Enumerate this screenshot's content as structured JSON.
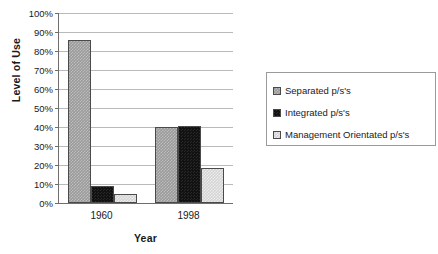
{
  "chart_data": {
    "type": "bar",
    "title": "",
    "xlabel": "Year",
    "ylabel": "Level of Use",
    "categories": [
      "1960",
      "1998"
    ],
    "series": [
      {
        "name": "Separated p/s's",
        "values": [
          86,
          40
        ],
        "color": "#9a9a9a"
      },
      {
        "name": "Integrated p/s's",
        "values": [
          9,
          40.5
        ],
        "color": "#121212"
      },
      {
        "name": "Management Orientated p/s's",
        "values": [
          4.5,
          18.5
        ],
        "color": "#d4d4d4"
      }
    ],
    "ylim": [
      0,
      100
    ],
    "ytick_labels": [
      "100%",
      "90%",
      "80%",
      "70%",
      "60%",
      "50%",
      "40%",
      "30%",
      "20%",
      "10%",
      "0%"
    ],
    "ytick_values": [
      100,
      90,
      80,
      70,
      60,
      50,
      40,
      30,
      20,
      10,
      0
    ],
    "grid": true,
    "legend_position": "right"
  }
}
